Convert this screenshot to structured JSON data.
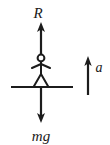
{
  "figure": {
    "type": "free-body-diagram",
    "background_color": "#ffffff",
    "ink_color": "#1c1c1c"
  },
  "labels": {
    "normal_force": "R",
    "weight": "mg",
    "acceleration": "a"
  },
  "vectors": [
    {
      "name": "normal-force",
      "label": "R",
      "direction": "up",
      "tail": {
        "x": 41,
        "y": 55
      },
      "tip": {
        "x": 41,
        "y": 23
      },
      "label_pos": {
        "x": 38,
        "y": 17
      }
    },
    {
      "name": "weight",
      "label": "mg",
      "direction": "down",
      "tail": {
        "x": 41,
        "y": 88
      },
      "tip": {
        "x": 41,
        "y": 122
      },
      "label_pos": {
        "x": 32,
        "y": 140
      }
    },
    {
      "name": "acceleration",
      "label": "a",
      "direction": "up",
      "tail": {
        "x": 88,
        "y": 95
      },
      "tip": {
        "x": 88,
        "y": 57
      },
      "label_pos": {
        "x": 95,
        "y": 71
      }
    }
  ],
  "ground": {
    "name": "ground-line",
    "x_start": 11,
    "x_end": 73,
    "y": 87
  },
  "stick_figure": {
    "head": {
      "cx": 41,
      "cy": 58,
      "r": 3.4
    },
    "torso": {
      "x": 41,
      "y_top": 61,
      "y_bottom": 75
    },
    "arms": {
      "y": 66,
      "x_left": 32,
      "x_right": 50,
      "shoulder_y": 63
    },
    "legs": {
      "hip_y": 74,
      "foot_y": 87,
      "x_left": 33,
      "x_right": 49
    }
  }
}
